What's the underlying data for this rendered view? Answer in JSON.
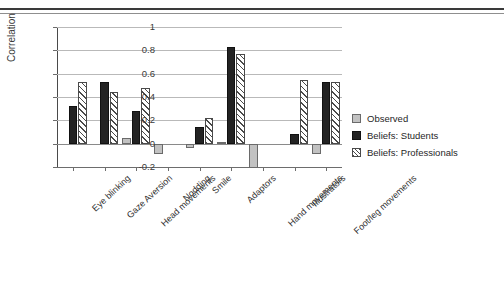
{
  "chart_data": {
    "type": "bar",
    "title": "",
    "xlabel": "",
    "ylabel": "Correlation",
    "ylim": [
      -0.2,
      1
    ],
    "yticks": [
      -0.2,
      0,
      0.2,
      0.4,
      0.6,
      0.8,
      1
    ],
    "ytick_labels": [
      "-0.2",
      "0",
      "0.2",
      "0.4",
      "0.6",
      "0.8",
      "1"
    ],
    "grid": true,
    "legend_position": "right",
    "categories": [
      "Eye blinking",
      "Gaze Aversion",
      "Head movements",
      "Nodding",
      "Smile",
      "Adaptors",
      "Hand movements",
      "Illustrators",
      "Foot/leg movements"
    ],
    "series": [
      {
        "name": "Observed",
        "color": "#c2c2c2",
        "values": [
          0.0,
          0.0,
          0.05,
          -0.09,
          -0.04,
          0.01,
          -0.21,
          0.0,
          -0.09
        ]
      },
      {
        "name": "Beliefs: Students",
        "color": "#232323",
        "values": [
          0.32,
          0.53,
          0.28,
          0.0,
          0.14,
          0.83,
          0.0,
          0.08,
          0.53
        ]
      },
      {
        "name": "Beliefs: Professionals",
        "color": "#ffffff",
        "values": [
          0.53,
          0.44,
          0.48,
          0.0,
          0.22,
          0.77,
          0.0,
          0.55,
          0.53
        ]
      }
    ]
  },
  "legend": {
    "items": [
      {
        "label": "Observed",
        "swatch": "observed"
      },
      {
        "label": "Beliefs: Students",
        "swatch": "students"
      },
      {
        "label": "Beliefs: Professionals",
        "swatch": "professionals"
      }
    ]
  }
}
